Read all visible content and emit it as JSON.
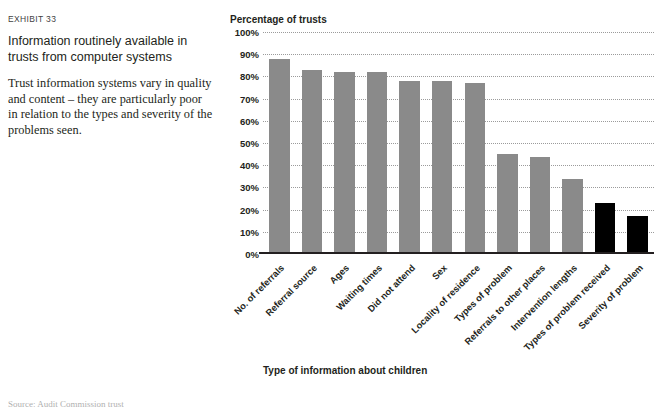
{
  "exhibit": {
    "label": "EXHIBIT 33",
    "title": "Information routinely available in trusts from computer systems",
    "description": "Trust information systems vary in quality and content – they are particularly poor in relation to the types and severity of the problems seen."
  },
  "source_note": "Source: Audit Commission trust",
  "colors": {
    "bar_gray": "#8a8a8a",
    "bar_black": "#000000",
    "axis": "#231f20",
    "gridline": "#9b9b9b",
    "text": "#231f20"
  },
  "chart_data": {
    "type": "bar",
    "title": "Percentage of trusts",
    "xlabel": "Type of information about children",
    "ylabel": "Percentage of trusts",
    "ylim": [
      0,
      100
    ],
    "yticks": [
      0,
      10,
      20,
      30,
      40,
      50,
      60,
      70,
      80,
      90,
      100
    ],
    "ytick_labels": [
      "0%",
      "10%",
      "20%",
      "30%",
      "40%",
      "50%",
      "60%",
      "70%",
      "80%",
      "90%",
      "100%"
    ],
    "grid": true,
    "legend": "none",
    "categories": [
      "No. of referrals",
      "Referral source",
      "Ages",
      "Waiting times",
      "Did not attend",
      "Sex",
      "Locality of residence",
      "Types of problem",
      "Referrals to other places",
      "Intervention lengths",
      "Types of problem received",
      "Severity of problem"
    ],
    "values": [
      87,
      82,
      81,
      81,
      77,
      77,
      76,
      44,
      43,
      33,
      22,
      16
    ],
    "bar_colors": [
      "#8a8a8a",
      "#8a8a8a",
      "#8a8a8a",
      "#8a8a8a",
      "#8a8a8a",
      "#8a8a8a",
      "#8a8a8a",
      "#8a8a8a",
      "#8a8a8a",
      "#8a8a8a",
      "#000000",
      "#000000"
    ]
  }
}
